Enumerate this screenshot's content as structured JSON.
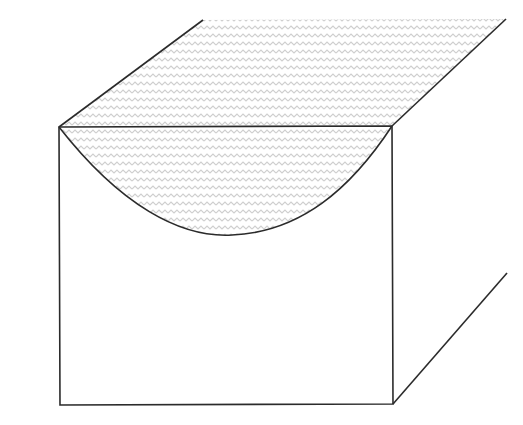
{
  "diagram": {
    "colors": {
      "background": "#ffffff",
      "stroke": "#2b2b2b",
      "pattern_stroke": "#cfcfcf"
    },
    "front_face": {
      "top_left": [
        59,
        127
      ],
      "top_right": [
        392,
        126
      ],
      "bottom_right": [
        393,
        404
      ],
      "bottom_left": [
        60,
        405
      ]
    },
    "depth_edges": {
      "top_left_back": [
        203,
        20
      ],
      "top_right_back": [
        506,
        19
      ],
      "bottom_right_back": [
        507,
        273
      ]
    },
    "curve": {
      "start": [
        59,
        127
      ],
      "control1": [
        120,
        205
      ],
      "control2": [
        180,
        240
      ],
      "mid": [
        232,
        235
      ],
      "control3": [
        300,
        232
      ],
      "control4": [
        350,
        190
      ],
      "end": [
        392,
        126
      ]
    },
    "fill_pattern": "wavy-lines"
  }
}
